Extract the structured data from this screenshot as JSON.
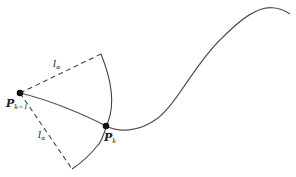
{
  "diagram": {
    "points": {
      "prev": {
        "label": "P",
        "subscript": "k−1",
        "x": 20,
        "y": 93
      },
      "curr": {
        "label": "P",
        "subscript": "k",
        "x": 106,
        "y": 126
      }
    },
    "lengths": {
      "upper": {
        "label": "l",
        "subscript": "α"
      },
      "lower": {
        "label": "l",
        "subscript": "α"
      }
    },
    "colors": {
      "curve": "#555555",
      "dashed": "#444444",
      "point": "#111111",
      "arc": "#444444"
    }
  }
}
